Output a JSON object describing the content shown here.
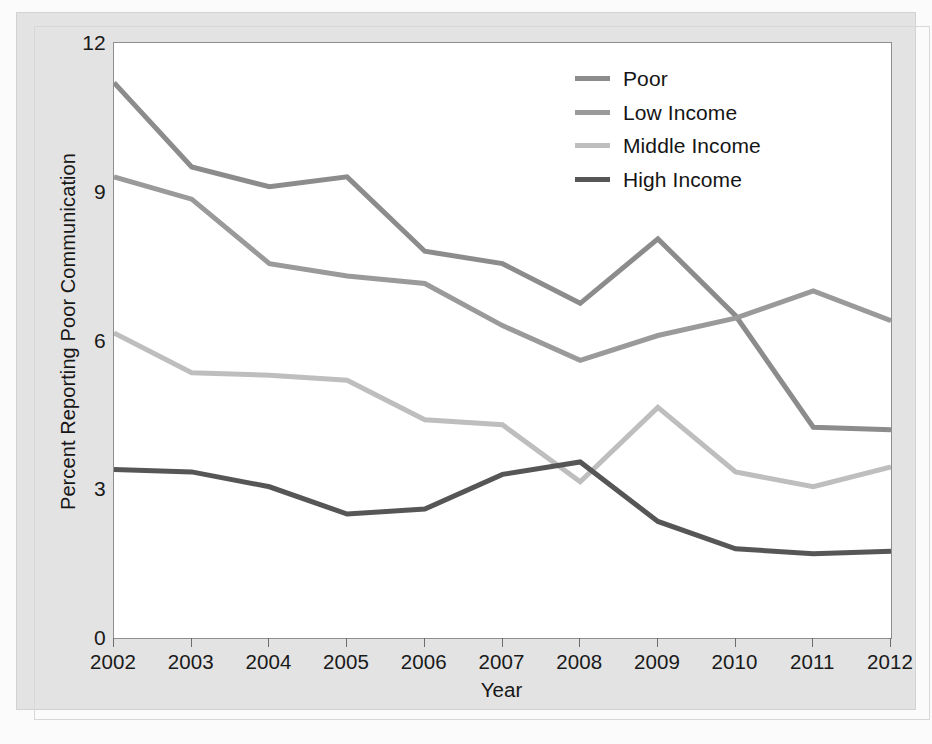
{
  "chart_data": {
    "type": "line",
    "title": "",
    "xlabel": "Year",
    "ylabel": "Percent Reporting Poor Communication",
    "x": [
      2002,
      2003,
      2004,
      2005,
      2006,
      2007,
      2008,
      2009,
      2010,
      2011,
      2012
    ],
    "xtick_labels": [
      "2002",
      "2003",
      "2004",
      "2005",
      "2006",
      "2007",
      "2008",
      "2009",
      "2010",
      "2011",
      "2012"
    ],
    "ytick_labels": [
      "0",
      "3",
      "6",
      "9",
      "12"
    ],
    "ytick_values": [
      0,
      3,
      6,
      9,
      12
    ],
    "ylim": [
      0,
      12
    ],
    "xlim": [
      2002,
      2012
    ],
    "grid": false,
    "legend_position": "top-right",
    "series": [
      {
        "name": "Poor",
        "color": "#8c8c8c",
        "values": [
          11.2,
          9.5,
          9.1,
          9.3,
          7.8,
          7.55,
          6.75,
          8.05,
          6.5,
          4.25,
          4.2
        ]
      },
      {
        "name": "Low Income",
        "color": "#9a9a9a",
        "values": [
          9.3,
          8.85,
          7.55,
          7.3,
          7.15,
          6.3,
          5.6,
          6.1,
          6.45,
          7.0,
          6.4
        ]
      },
      {
        "name": "Middle Income",
        "color": "#bebebe",
        "values": [
          6.15,
          5.35,
          5.3,
          5.2,
          4.4,
          4.3,
          3.15,
          4.65,
          3.35,
          3.05,
          3.45
        ]
      },
      {
        "name": "High Income",
        "color": "#565656",
        "values": [
          3.4,
          3.35,
          3.05,
          2.5,
          2.6,
          3.3,
          3.55,
          2.35,
          1.8,
          1.7,
          1.75
        ]
      }
    ]
  },
  "legend": {
    "entries": [
      {
        "label": "Poor",
        "color": "#8c8c8c"
      },
      {
        "label": "Low Income",
        "color": "#9a9a9a"
      },
      {
        "label": "Middle Income",
        "color": "#bebebe"
      },
      {
        "label": "High Income",
        "color": "#565656"
      }
    ]
  },
  "axes": {
    "x_title": "Year",
    "y_title": "Percent Reporting Poor Communication"
  },
  "colors": {
    "panel_background": "#e3e3e3",
    "plot_background": "#ffffff",
    "axis_line": "#8e8e8e",
    "text": "#1a1a1a"
  }
}
